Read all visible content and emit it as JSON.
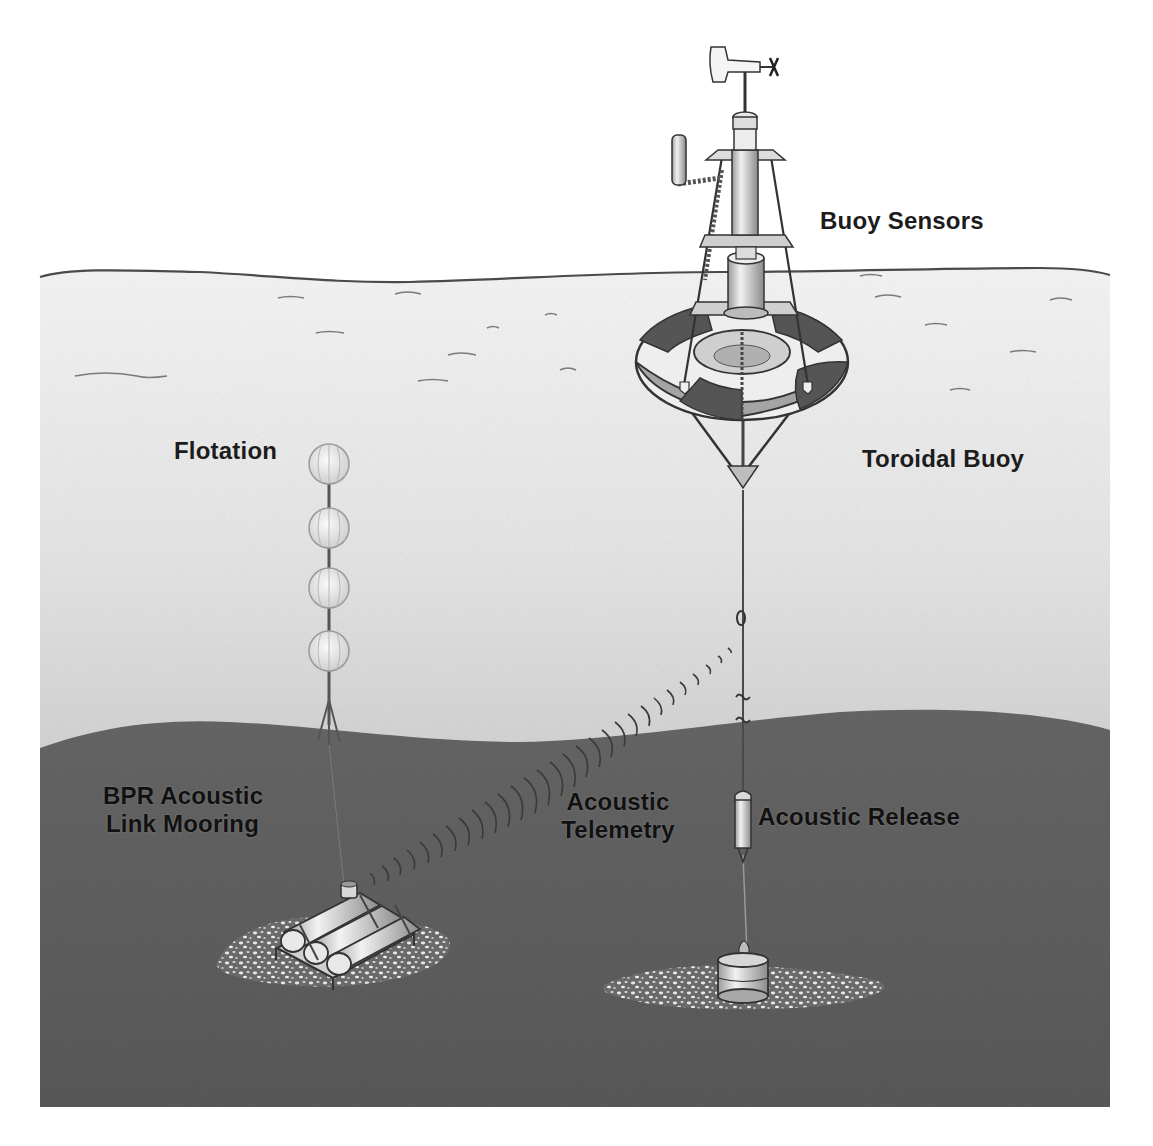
{
  "diagram": {
    "title": "",
    "colors": {
      "background": "#ffffff",
      "water_top": "#f4f4f4",
      "water_bottom": "#b4b4b4",
      "seafloor": "#5e5e5e",
      "line": "#3a3a3a",
      "buoy_dark": "#555555",
      "buoy_light": "#f6f6f6"
    },
    "labels": {
      "buoy_sensors": "Buoy Sensors",
      "toroidal_buoy": "Toroidal Buoy",
      "flotation": "Flotation",
      "bpr_line1": "BPR Acoustic",
      "bpr_line2": "Link Mooring",
      "telemetry_line1": "Acoustic",
      "telemetry_line2": "Telemetry",
      "acoustic_release": "Acoustic Release"
    },
    "components": [
      {
        "id": "buoy-sensors",
        "label": "Buoy Sensors",
        "icon": "wind-vane-mast-icon"
      },
      {
        "id": "toroidal-buoy",
        "label": "Toroidal Buoy",
        "icon": "toroidal-buoy-icon"
      },
      {
        "id": "flotation",
        "label": "Flotation",
        "icon": "glass-float-spheres-icon",
        "count": 4
      },
      {
        "id": "bpr-mooring",
        "label": "BPR Acoustic Link Mooring",
        "icon": "bottom-pressure-recorder-icon"
      },
      {
        "id": "acoustic-telemetry",
        "label": "Acoustic Telemetry",
        "icon": "acoustic-wave-arcs-icon"
      },
      {
        "id": "acoustic-release",
        "label": "Acoustic Release",
        "icon": "acoustic-release-cylinder-icon"
      },
      {
        "id": "anchor",
        "label": "",
        "icon": "anchor-weight-icon"
      }
    ]
  }
}
